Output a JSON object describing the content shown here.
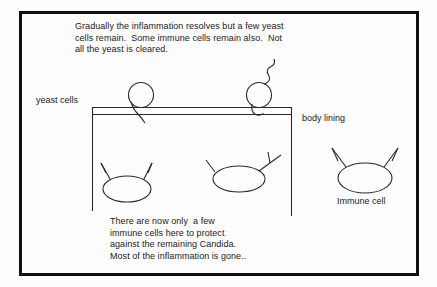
{
  "diagram": {
    "stroke_color": "#222222",
    "frame_color": "#111111",
    "background": "#fdfdfd",
    "notes": {
      "top": "Gradually the inflammation resolves but a few yeast\ncells remain.  Some immune cells remain also.  Not\nall the yeast is cleared.",
      "bottom": "There are now only  a few\nimmune cells here to protect\nagainst the remaining Candida.\nMost of the inflammation is gone.."
    },
    "labels": {
      "yeast_cells": "yeast cells",
      "body_lining": "body lining",
      "immune_cell": "Immune cell"
    },
    "objects": {
      "yeast_cells_count": 2,
      "immune_cells_count": 3,
      "lining_layers": 2
    }
  }
}
